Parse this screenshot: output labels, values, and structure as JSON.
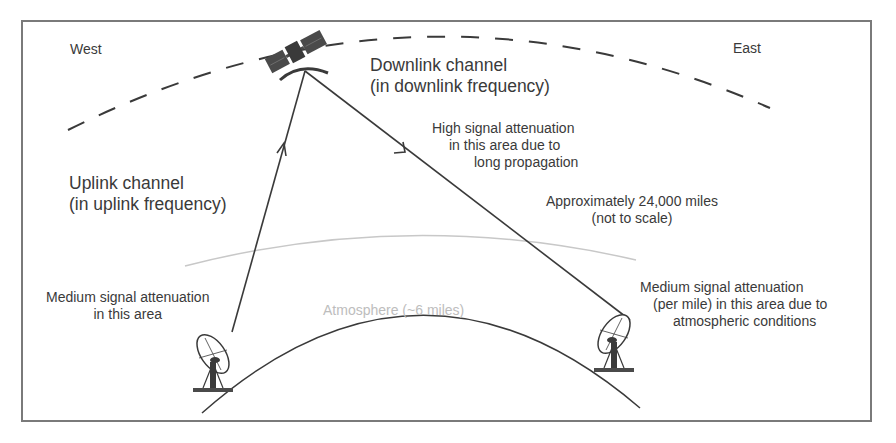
{
  "diagram": {
    "title": "",
    "directions": {
      "west": "West",
      "east": "East"
    },
    "downlink": {
      "title": "Downlink channel",
      "subtitle": "(in downlink frequency)"
    },
    "uplink": {
      "title": "Uplink channel",
      "subtitle": "(in uplink frequency)"
    },
    "notes": {
      "high_attenuation": [
        "High signal attenuation",
        "in this area due to",
        "long propagation"
      ],
      "distance": [
        "Approximately 24,000 miles",
        "(not to scale)"
      ],
      "medium_left": [
        "Medium signal attenuation",
        "in this area"
      ],
      "medium_right": [
        "Medium signal attenuation",
        "(per mile) in this area due to",
        "atmospheric conditions"
      ],
      "atmosphere": "Atmosphere (~6 miles)"
    },
    "icons": {
      "satellite": "satellite-icon",
      "ground_station_west": "satellite-dish-icon",
      "ground_station_east": "satellite-dish-icon"
    },
    "colors": {
      "line": "#3a3a3a",
      "atmosphere": "#c8c8c8",
      "frame": "#7a7a7a",
      "text": "#3a3a3a"
    }
  }
}
